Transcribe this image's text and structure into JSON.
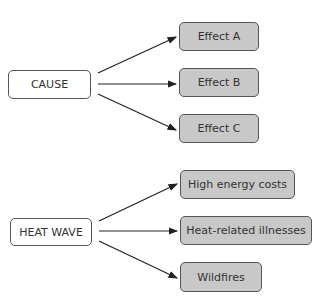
{
  "diagrams": [
    {
      "cause": {
        "label": "CAUSE"
      },
      "effects": [
        {
          "label": "Effect A"
        },
        {
          "label": "Effect B"
        },
        {
          "label": "Effect C"
        }
      ]
    },
    {
      "cause": {
        "label": "HEAT WAVE"
      },
      "effects": [
        {
          "label": "High energy costs"
        },
        {
          "label": "Heat-related illnesses"
        },
        {
          "label": "Wildfires"
        }
      ]
    }
  ],
  "colors": {
    "cause_fill": "#ffffff",
    "effect_fill": "#c8c8c8",
    "border": "#555555",
    "arrow": "#222222"
  }
}
